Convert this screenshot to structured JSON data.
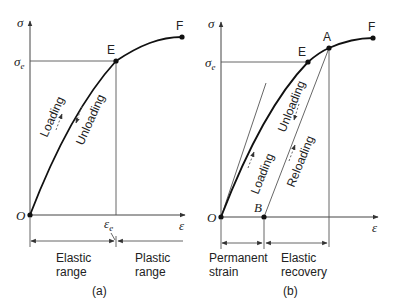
{
  "panel_a": {
    "caption": "(a)",
    "y_axis_label": "σ",
    "x_axis_label": "ε",
    "sigma_e_label": "σ",
    "sigma_e_sub": "e",
    "eps_e_label": "ε",
    "eps_e_sub": "e",
    "origin_label": "O",
    "point_E": "E",
    "point_F": "F",
    "loading_label": "Loading",
    "unloading_label": "Unloading",
    "elastic_range": [
      "Elastic",
      "range"
    ],
    "plastic_range": [
      "Plastic",
      "range"
    ]
  },
  "panel_b": {
    "caption": "(b)",
    "y_axis_label": "σ",
    "x_axis_label": "ε",
    "sigma_e_label": "σ",
    "sigma_e_sub": "e",
    "origin_label": "O",
    "point_E": "E",
    "point_A": "A",
    "point_F": "F",
    "point_B": "B",
    "loading_label": "Loading",
    "unloading_label": "Unloading",
    "reloading_label": "Reloading",
    "permanent_strain": [
      "Permanent",
      "strain"
    ],
    "elastic_recovery": [
      "Elastic",
      "recovery"
    ]
  }
}
